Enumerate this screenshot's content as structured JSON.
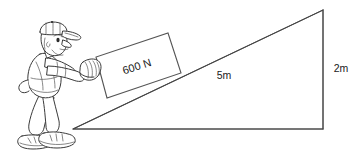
{
  "figure": {
    "background_color": "#ffffff",
    "line_color": "#555555",
    "ink_color": "#3a3a3a",
    "text_color": "#1a1a1a"
  },
  "labels": {
    "box_force": "600 N",
    "ramp_length": "5m",
    "ramp_height": "2m"
  },
  "geometry": {
    "ramp": {
      "base_left_x": 73,
      "base_left_y": 129,
      "base_right_x": 323,
      "base_right_y": 129,
      "apex_x": 323,
      "apex_y": 10
    },
    "box": {
      "corner_lower_left_x": 107,
      "corner_lower_left_y": 98,
      "corner_upper_left_x": 96,
      "corner_upper_left_y": 57,
      "corner_upper_right_x": 168,
      "corner_upper_right_y": 33,
      "corner_lower_right_x": 181,
      "corner_lower_right_y": 73
    }
  },
  "parts": {
    "person": "person-pushing",
    "cap": "baseball-cap",
    "hand": "pushing-hand",
    "ramp": "inclined-ramp",
    "box": "load-box",
    "ground": "ground-line",
    "height_line": "height-dimension-line"
  }
}
